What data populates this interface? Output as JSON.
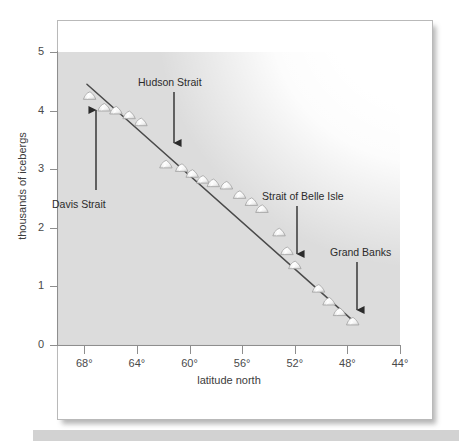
{
  "figure": {
    "caption_bar": "",
    "background_color": "#ffffff",
    "card_border_color": "#b9b9b9",
    "plot_fill_color": "#dcdcdc",
    "axis_color": "#8e8e8e",
    "trend_line_color": "#4a4a4a",
    "marker_fill_color": "#f2f2f2",
    "marker_stroke_color": "#9a9a9a",
    "annotation_color": "#2b2b2b"
  },
  "chart_data": {
    "type": "scatter",
    "title": "",
    "subtitle": "",
    "xlabel": "latitude north",
    "ylabel": "thousands of icebergs",
    "xlim": [
      70,
      44
    ],
    "ylim": [
      0,
      5
    ],
    "x_inverted": true,
    "grid": false,
    "legend": "none",
    "x_ticks": [
      68,
      64,
      60,
      56,
      52,
      48,
      44
    ],
    "x_tick_labels": [
      "68°",
      "64°",
      "60°",
      "56°",
      "52°",
      "48°",
      "44°"
    ],
    "y_ticks": [
      0,
      1,
      2,
      3,
      4,
      5
    ],
    "y_tick_labels": [
      "0",
      "1",
      "2",
      "3",
      "4",
      "5"
    ],
    "marker_shape": "iceberg",
    "series": [
      {
        "name": "icebergs",
        "points": [
          {
            "x": 67.6,
            "y": 4.25
          },
          {
            "x": 66.5,
            "y": 4.05
          },
          {
            "x": 65.6,
            "y": 4.0
          },
          {
            "x": 64.6,
            "y": 3.92
          },
          {
            "x": 63.7,
            "y": 3.8
          },
          {
            "x": 61.8,
            "y": 3.08
          },
          {
            "x": 60.6,
            "y": 3.02
          },
          {
            "x": 59.8,
            "y": 2.92
          },
          {
            "x": 59.0,
            "y": 2.82
          },
          {
            "x": 58.2,
            "y": 2.76
          },
          {
            "x": 57.2,
            "y": 2.72
          },
          {
            "x": 56.2,
            "y": 2.56
          },
          {
            "x": 55.3,
            "y": 2.44
          },
          {
            "x": 54.5,
            "y": 2.32
          },
          {
            "x": 53.2,
            "y": 1.92
          },
          {
            "x": 52.6,
            "y": 1.6
          },
          {
            "x": 52.0,
            "y": 1.36
          },
          {
            "x": 50.2,
            "y": 0.96
          },
          {
            "x": 49.4,
            "y": 0.74
          },
          {
            "x": 48.6,
            "y": 0.56
          },
          {
            "x": 47.6,
            "y": 0.4
          }
        ]
      }
    ],
    "trend_line": {
      "name": "regression-line",
      "x_start": 67.8,
      "y_start": 4.45,
      "x_end": 47.6,
      "y_end": 0.42
    },
    "annotations": [
      {
        "id": "davis-strait",
        "label": "Davis Strait",
        "arrow_direction": "up",
        "label_x": 52,
        "label_y": 198,
        "arrow_x": 96,
        "arrow_tail_y": 190,
        "arrow_head_y": 110
      },
      {
        "id": "hudson-strait",
        "label": "Hudson Strait",
        "arrow_direction": "down",
        "label_x": 138,
        "label_y": 76,
        "arrow_x": 174,
        "arrow_tail_y": 92,
        "arrow_head_y": 143
      },
      {
        "id": "strait-of-belle-isle",
        "label": "Strait of Belle Isle",
        "arrow_direction": "down",
        "label_x": 262,
        "label_y": 190,
        "arrow_x": 297,
        "arrow_tail_y": 206,
        "arrow_head_y": 254
      },
      {
        "id": "grand-banks",
        "label": "Grand Banks",
        "arrow_direction": "down",
        "label_x": 330,
        "label_y": 246,
        "arrow_x": 357,
        "arrow_tail_y": 262,
        "arrow_head_y": 310
      }
    ]
  }
}
